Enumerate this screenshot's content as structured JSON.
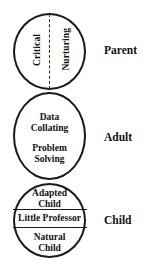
{
  "diagram": {
    "stroke_color": "#1a1a1a",
    "text_color": "#111111",
    "background_color": "#ffffff",
    "states": [
      {
        "id": "parent",
        "side_label": "Parent",
        "divider_style": "vertical-dashed",
        "compartments": [
          {
            "id": "critical",
            "label": "Critical",
            "orientation": "vertical-rotated"
          },
          {
            "id": "nurturing",
            "label": "Nurturing",
            "orientation": "vertical-rotated"
          }
        ]
      },
      {
        "id": "adult",
        "side_label": "Adult",
        "divider_style": "none",
        "compartments": [
          {
            "id": "data-collating",
            "line1": "Data",
            "line2": "Collating"
          },
          {
            "id": "problem-solving",
            "line1": "Problem",
            "line2": "Solving"
          }
        ]
      },
      {
        "id": "child",
        "side_label": "Child",
        "divider_style": "horizontal-solid-x2",
        "compartments": [
          {
            "id": "adapted-child",
            "line1": "Adapted",
            "line2": "Child"
          },
          {
            "id": "little-professor",
            "line1": "Little Professor",
            "line2": ""
          },
          {
            "id": "natural-child",
            "line1": "Natural",
            "line2": "Child"
          }
        ]
      }
    ]
  }
}
